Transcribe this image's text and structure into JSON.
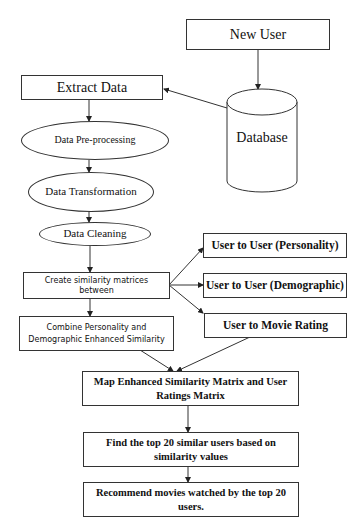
{
  "diagram": {
    "type": "flowchart",
    "nodes": {
      "new_user": {
        "label": "New User",
        "shape": "rectangle"
      },
      "database": {
        "label": "Database",
        "shape": "cylinder"
      },
      "extract_data": {
        "label": "Extract Data",
        "shape": "rectangle"
      },
      "pre_processing": {
        "label": "Data Pre-processing",
        "shape": "ellipse"
      },
      "transformation": {
        "label": "Data Transformation",
        "shape": "ellipse"
      },
      "cleaning": {
        "label": "Data Cleaning",
        "shape": "ellipse"
      },
      "create_similarity": {
        "label": "Create similarity matrices between",
        "shape": "rectangle"
      },
      "personality": {
        "label": "User to User (Personality)",
        "shape": "rectangle"
      },
      "demographic": {
        "label": "User to User (Demographic)",
        "shape": "rectangle"
      },
      "movie_rating": {
        "label": "User to Movie Rating",
        "shape": "rectangle"
      },
      "combine": {
        "label": "Combine Personality and Demographic Enhanced Similarity",
        "shape": "rectangle"
      },
      "map_matrix": {
        "label": "Map Enhanced Similarity  Matrix and User Ratings Matrix",
        "shape": "rectangle"
      },
      "find_top": {
        "label": "Find the top 20 similar  users based on similarity  values",
        "shape": "rectangle"
      },
      "recommend": {
        "label": "Recommend movies watched by the top 20 users.",
        "shape": "rectangle"
      }
    },
    "edges": [
      {
        "from": "new_user",
        "to": "database"
      },
      {
        "from": "database",
        "to": "extract_data"
      },
      {
        "from": "extract_data",
        "to": "pre_processing"
      },
      {
        "from": "pre_processing",
        "to": "transformation"
      },
      {
        "from": "transformation",
        "to": "cleaning"
      },
      {
        "from": "cleaning",
        "to": "create_similarity"
      },
      {
        "from": "create_similarity",
        "to": "personality"
      },
      {
        "from": "create_similarity",
        "to": "demographic"
      },
      {
        "from": "create_similarity",
        "to": "movie_rating"
      },
      {
        "from": "create_similarity",
        "to": "combine"
      },
      {
        "from": "combine",
        "to": "map_matrix"
      },
      {
        "from": "movie_rating",
        "to": "map_matrix"
      },
      {
        "from": "map_matrix",
        "to": "find_top"
      },
      {
        "from": "find_top",
        "to": "recommend"
      }
    ]
  },
  "colors": {
    "stroke": "#333333",
    "text": "#111111",
    "background": "#ffffff"
  }
}
